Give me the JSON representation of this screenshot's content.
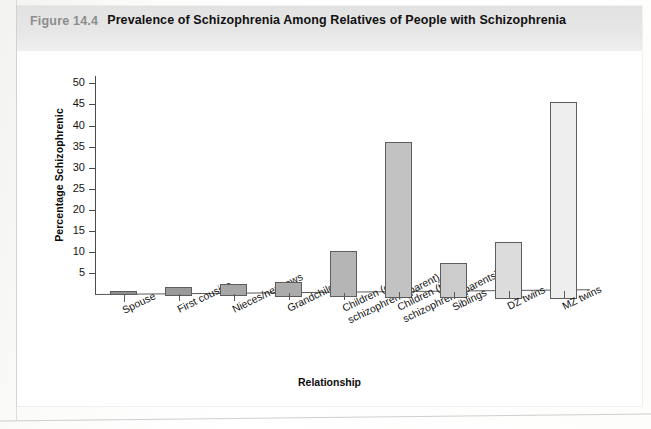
{
  "figure": {
    "number": "Figure 14.4",
    "title": "Prevalence of Schizophrenia Among Relatives of People with Schizophrenia"
  },
  "chart_data": {
    "type": "bar",
    "title": "Prevalence of Schizophrenia Among Relatives of People with Schizophrenia",
    "xlabel": "Relationship",
    "ylabel": "Percentage Schizophrenic",
    "ylim": [
      0,
      52
    ],
    "yticks": [
      5,
      10,
      15,
      20,
      25,
      30,
      35,
      40,
      45,
      50
    ],
    "ytick_labels": [
      "5",
      "10",
      "15",
      "20",
      "25",
      "30",
      "35",
      "40",
      "45",
      "50"
    ],
    "grid": false,
    "legend": null,
    "categories": [
      "Spouse",
      "First cousins",
      "Nieces/nephews",
      "Grandchildren",
      "Children (one schizophrenic parent)",
      "Children (two schizophrenic parents)",
      "Siblings",
      "DZ twins",
      "MZ twins"
    ],
    "category_lines": [
      [
        "Spouse",
        ""
      ],
      [
        "First cousins",
        ""
      ],
      [
        "Nieces/nephews",
        ""
      ],
      [
        "Grandchildren",
        ""
      ],
      [
        "Children (one",
        "schizophrenic parent)"
      ],
      [
        "Children (two",
        "schizophrenic parents)"
      ],
      [
        "Siblings",
        ""
      ],
      [
        "DZ twins",
        ""
      ],
      [
        "MZ twins",
        ""
      ]
    ],
    "values": [
      1,
      2,
      3,
      3.5,
      11,
      37,
      8.5,
      13.5,
      47
    ],
    "bar_colors": [
      "#8e8e8e",
      "#9a9a9a",
      "#a6a6a6",
      "#ababab",
      "#b5b5b5",
      "#c2c2c2",
      "#cccccc",
      "#dcdcdc",
      "#eeeeee"
    ],
    "bar_edge_color": "#5d5d5d",
    "axis_color": "#4a4a4a",
    "background": "#ffffff"
  }
}
